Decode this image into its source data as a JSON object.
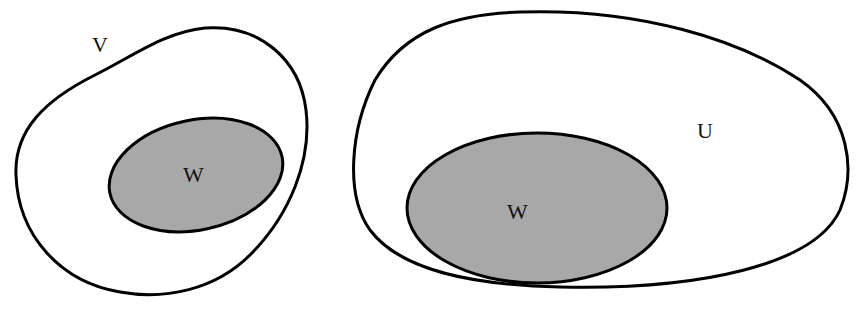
{
  "diagram": {
    "left": {
      "outer_label": "V",
      "inner_label": "W"
    },
    "right": {
      "outer_label": "U",
      "inner_label": "W"
    },
    "colors": {
      "stroke": "#000000",
      "inner_fill": "#a8a8a8",
      "background": "#ffffff"
    }
  }
}
